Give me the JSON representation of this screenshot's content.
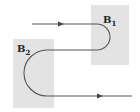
{
  "diagram": {
    "regions": [
      {
        "id": "B1",
        "label": "B",
        "subscript": "1",
        "x": 91,
        "y": 5,
        "w": 38,
        "h": 60
      },
      {
        "id": "B2",
        "label": "B",
        "subscript": "2",
        "x": 13,
        "y": 39,
        "w": 41,
        "h": 69
      }
    ],
    "path": {
      "color": "#555555",
      "description": "Particle trajectory: enters left moving right, curves through field B1 (U-turn), returns left, curves through field B2 (U-turn), exits right"
    },
    "arrows": [
      {
        "name": "arrow-top",
        "x": 62,
        "y": 24,
        "direction": "right"
      },
      {
        "name": "arrow-bottom",
        "x": 101,
        "y": 96,
        "direction": "right"
      }
    ],
    "colors": {
      "region": "#e3e3e3",
      "line": "#555555",
      "text": "#222222"
    }
  }
}
